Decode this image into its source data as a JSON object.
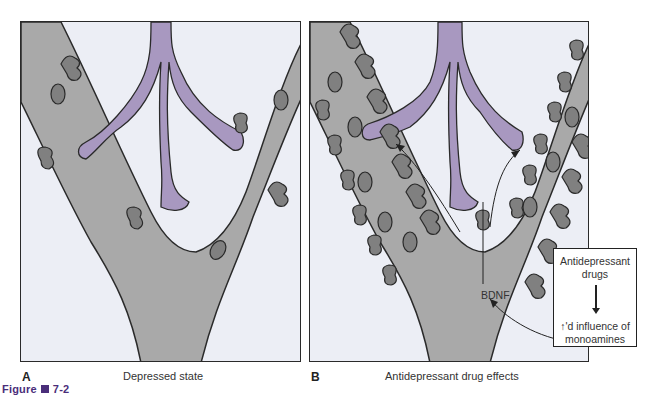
{
  "figure": {
    "label": "Figure",
    "number": "7-2",
    "accent_color": "#4a2e7a"
  },
  "panels": [
    {
      "letter": "A",
      "caption": "Depressed state",
      "spine_density": "sparse"
    },
    {
      "letter": "B",
      "caption": "Antidepressant drug effects",
      "spine_density": "dense"
    }
  ],
  "annotations": {
    "bdnf": "BDNF",
    "box_top": "Antidepressant drugs",
    "box_top_line1": "Antidepressant",
    "box_top_line2": "drugs",
    "box_bottom_line1": "↑'d influence of",
    "box_bottom_line2": "monoamines"
  },
  "colors": {
    "background": "#eceef5",
    "dendrite": "#a9a9a9",
    "spine": "#808080",
    "axon": "#a898c0",
    "outline": "#2a2a2a"
  }
}
